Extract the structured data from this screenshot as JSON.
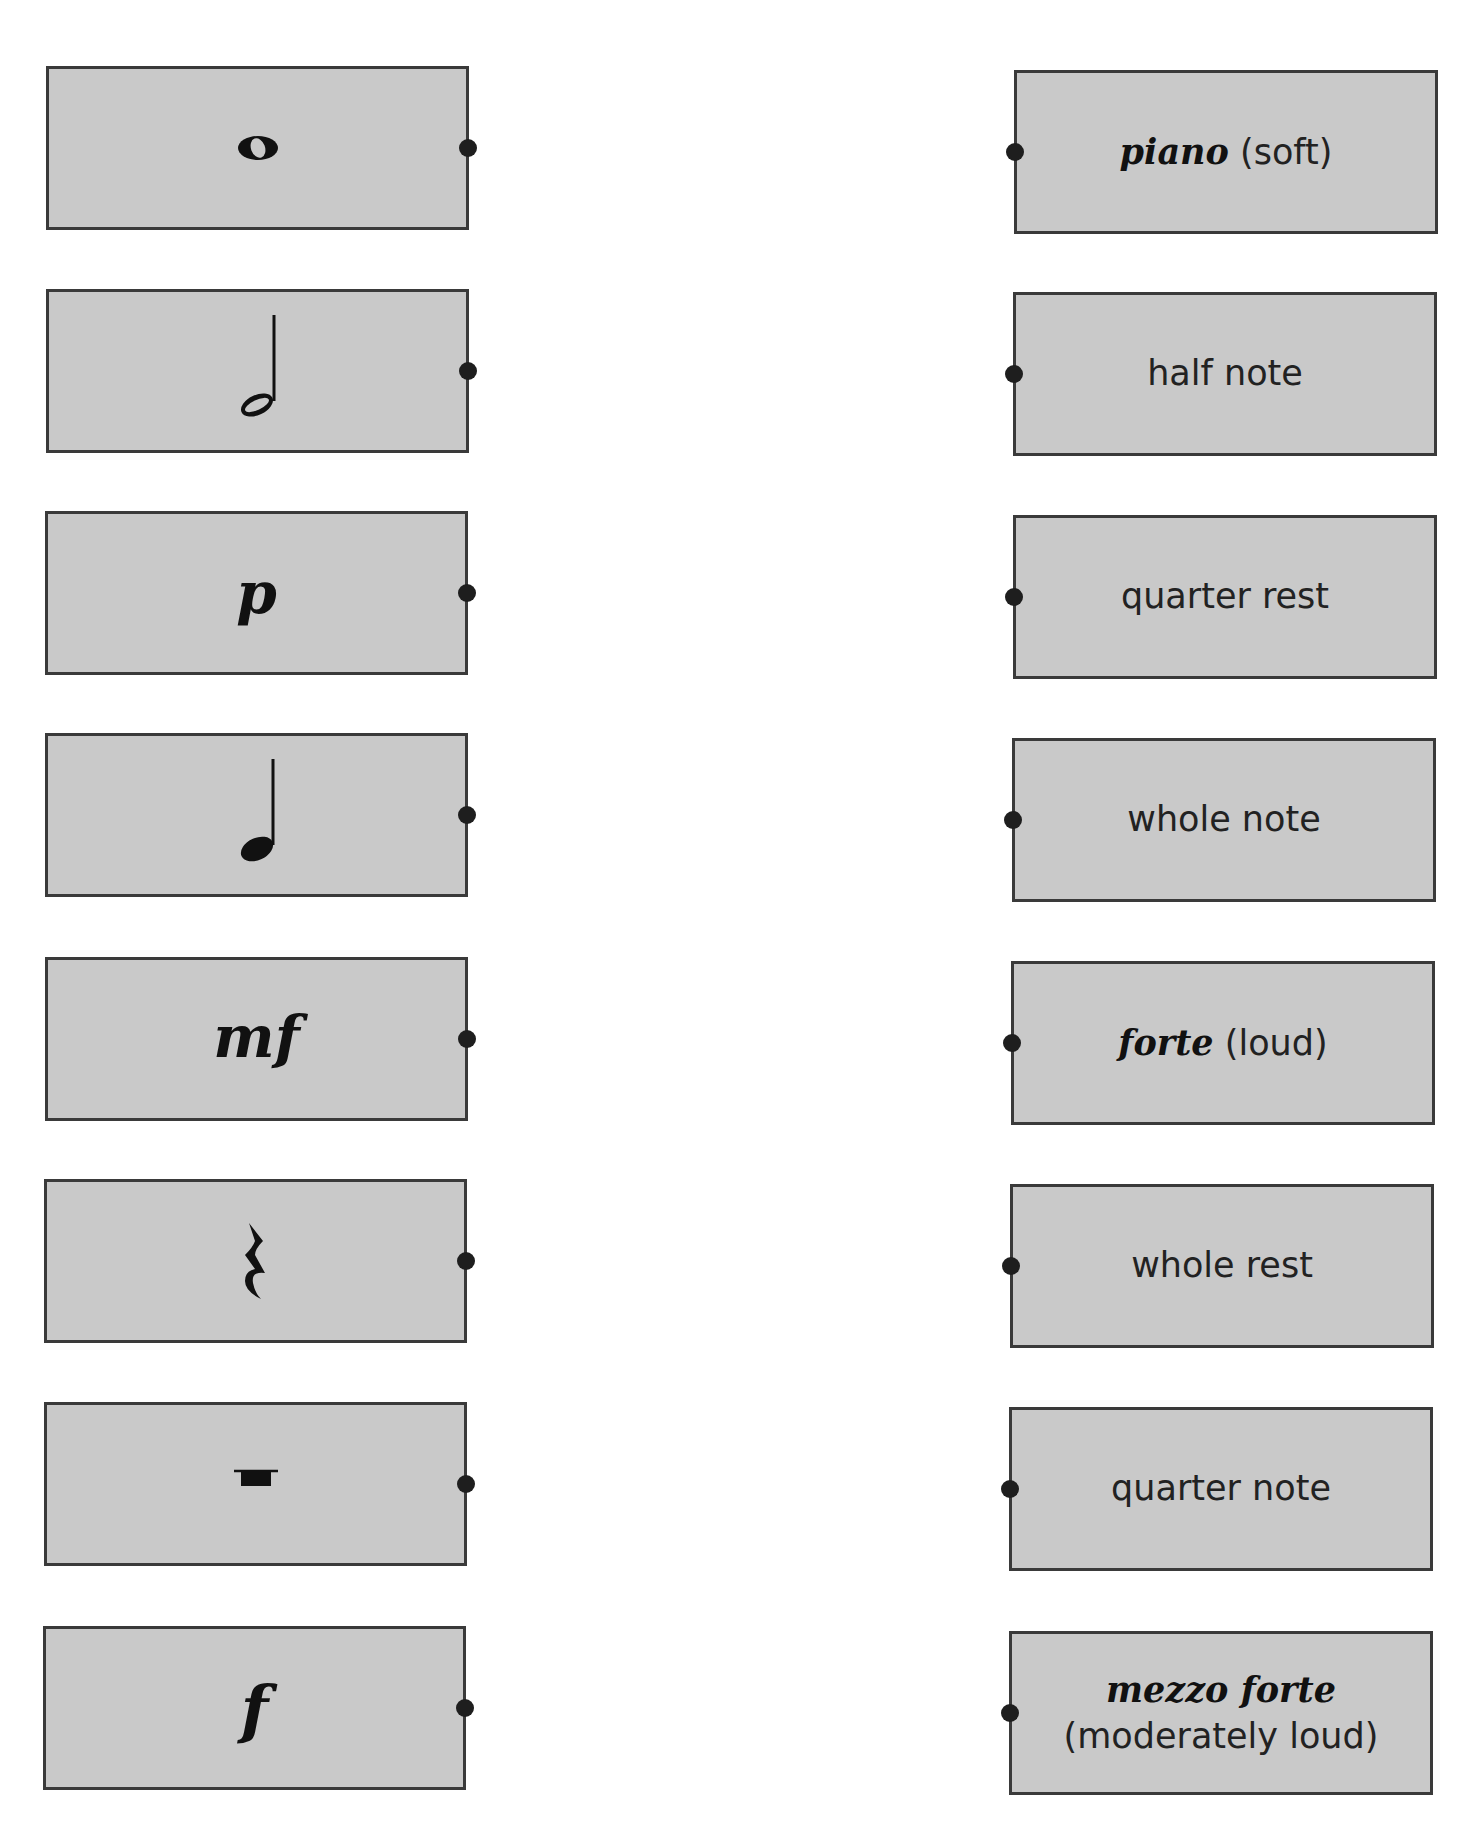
{
  "left_column": [
    {
      "id": "L1",
      "symbol": "whole-note",
      "text": ""
    },
    {
      "id": "L2",
      "symbol": "half-note",
      "text": ""
    },
    {
      "id": "L3",
      "symbol": "dynamic-p",
      "text": "p"
    },
    {
      "id": "L4",
      "symbol": "quarter-note",
      "text": ""
    },
    {
      "id": "L5",
      "symbol": "dynamic-mf",
      "text": "mf"
    },
    {
      "id": "L6",
      "symbol": "quarter-rest",
      "text": ""
    },
    {
      "id": "L7",
      "symbol": "whole-rest",
      "text": ""
    },
    {
      "id": "L8",
      "symbol": "dynamic-f",
      "text": "f"
    }
  ],
  "right_column": [
    {
      "term": "piano",
      "desc": "(soft)"
    },
    {
      "term": "",
      "desc": "half note"
    },
    {
      "term": "",
      "desc": "quarter rest"
    },
    {
      "term": "",
      "desc": "whole note"
    },
    {
      "term": "forte",
      "desc": "(loud)"
    },
    {
      "term": "",
      "desc": "whole rest"
    },
    {
      "term": "",
      "desc": "quarter note"
    },
    {
      "term": "mezzo forte",
      "desc": "(moderately loud)"
    }
  ],
  "colors": {
    "card_fill": "#c9c9c9",
    "card_border": "#3a3a3a",
    "connector_dot": "#1e1e1e",
    "ink": "#111111"
  }
}
